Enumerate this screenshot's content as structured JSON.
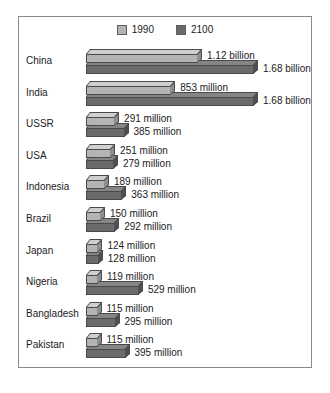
{
  "chart_data": {
    "type": "bar",
    "title": "",
    "xlabel": "",
    "ylabel": "",
    "orientation": "horizontal",
    "grid": false,
    "legend_position": "top-center",
    "xlim": [
      0,
      1680
    ],
    "unit_note": "values in millions of people",
    "categories": [
      "China",
      "India",
      "USSR",
      "USA",
      "Indonesia",
      "Brazil",
      "Japan",
      "Nigeria",
      "Bangladesh",
      "Pakistan"
    ],
    "series": [
      {
        "name": "1990",
        "color": "#b4b4b4",
        "values": [
          1120,
          853,
          291,
          251,
          189,
          150,
          124,
          119,
          115,
          115
        ],
        "labels": [
          "1.12 billion",
          "853 million",
          "291 million",
          "251 million",
          "189 million",
          "150 million",
          "124 million",
          "119 million",
          "115 million",
          "115 million"
        ]
      },
      {
        "name": "2100",
        "color": "#6b6b6b",
        "values": [
          1680,
          1680,
          385,
          279,
          363,
          292,
          128,
          529,
          295,
          395
        ],
        "labels": [
          "1.68 billion",
          "1.68 billion",
          "385 million",
          "279 million",
          "363 million",
          "292 million",
          "128 million",
          "529 million",
          "295 million",
          "395 million"
        ]
      }
    ]
  },
  "legend": {
    "entries": [
      {
        "label": "1990",
        "color": "#b4b4b4"
      },
      {
        "label": "2100",
        "color": "#6b6b6b"
      }
    ]
  },
  "caption": {
    "text": ""
  }
}
